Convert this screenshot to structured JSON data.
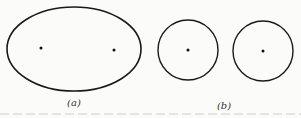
{
  "figure": {
    "panels": [
      {
        "id": "a",
        "label": "(a)",
        "shape": "ellipse",
        "center": [
          74,
          49
        ],
        "rx": 67,
        "ry": 42,
        "points": [
          [
            41,
            48
          ],
          [
            114,
            50
          ]
        ]
      },
      {
        "id": "b",
        "label": "(b)",
        "shapes": [
          {
            "shape": "circle",
            "center": [
              188,
              50
            ],
            "r": 30,
            "point": [
              188,
              50
            ]
          },
          {
            "shape": "circle",
            "center": [
              263,
              51
            ],
            "r": 30,
            "point": [
              263,
              51
            ]
          }
        ]
      }
    ],
    "stroke_color": "#1a1a1a",
    "background": "#fbfbfa"
  }
}
